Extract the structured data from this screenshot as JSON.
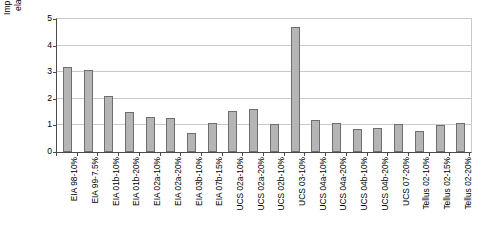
{
  "chart_data": {
    "type": "bar",
    "title": "",
    "xlabel": "",
    "ylabel": "Implicit inverse price\nelasticity of supply",
    "ylim": [
      0,
      5
    ],
    "ytick_labels": [
      "0",
      "1",
      "2",
      "3",
      "4",
      "5"
    ],
    "yticks": [
      0,
      1,
      2,
      3,
      4,
      5
    ],
    "grid": true,
    "legend": null,
    "bar_color": "#b5b5b5",
    "bar_edge_color": "#6e6e6e",
    "categories": [
      "EIA 98-10%",
      "EIA 99-7.5%",
      "EIA 01b-10%",
      "EIA 01b-20%",
      "EIA 02a-10%",
      "EIA 02a-20%",
      "EIA 03b-10%",
      "EIA 07b-15%",
      "UCS 02a-10%",
      "UCS 02a-20%",
      "UCS 02b-10%",
      "UCS 03-10%",
      "UCS 04a-10%",
      "UCS 04a-20%",
      "UCS 04b-10%",
      "UCS 04b-20%",
      "UCS 07-20%",
      "Tellus 02-10%",
      "Tellus 02-15%",
      "Tellus 02-20%"
    ],
    "values": [
      3.2,
      3.1,
      2.1,
      1.5,
      1.3,
      1.28,
      0.72,
      1.1,
      1.55,
      1.6,
      1.05,
      4.7,
      1.22,
      1.1,
      0.88,
      0.9,
      1.05,
      0.8,
      1.0,
      1.1
    ]
  }
}
